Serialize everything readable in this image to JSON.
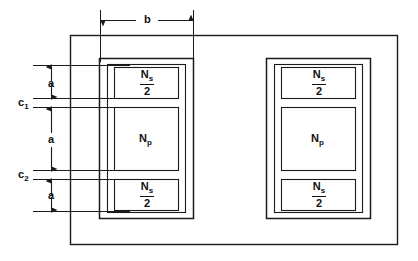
{
  "diagram": {
    "stroke_color": "#1a1a1a",
    "background": "#ffffff",
    "dimensions": {
      "b": "b",
      "a_top": "a",
      "a_middle": "a",
      "a_bottom": "a",
      "c1_letter": "c",
      "c1_sub": "1",
      "c2_letter": "c",
      "c2_sub": "2"
    },
    "left_coil": {
      "windings": [
        {
          "numerator": "N",
          "numerator_sub": "s",
          "denominator": "2"
        },
        {
          "symbol": "N",
          "symbol_sub": "p"
        },
        {
          "numerator": "N",
          "numerator_sub": "s",
          "denominator": "2"
        }
      ]
    },
    "right_coil": {
      "windings": [
        {
          "numerator": "N",
          "numerator_sub": "s",
          "denominator": "2"
        },
        {
          "symbol": "N",
          "symbol_sub": "p"
        },
        {
          "numerator": "N",
          "numerator_sub": "s",
          "denominator": "2"
        }
      ]
    }
  }
}
